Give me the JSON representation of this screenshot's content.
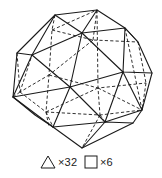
{
  "figure": {
    "solid_edge_color": "#1a1a1a",
    "hidden_edge_style": "dashed"
  },
  "legend": {
    "items": [
      {
        "shape": "triangle-icon",
        "label": "×32"
      },
      {
        "shape": "square-icon",
        "label": "×6"
      }
    ]
  }
}
